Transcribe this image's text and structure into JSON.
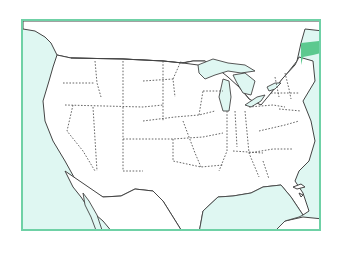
{
  "map": {
    "title": "United States outline map",
    "highlighted_state": "Maine",
    "colors": {
      "frame_border": "#6fd1a6",
      "water": "#dff7f2",
      "land": "#ffffff",
      "highlight": "#5cc98f",
      "outline": "#444444"
    }
  }
}
